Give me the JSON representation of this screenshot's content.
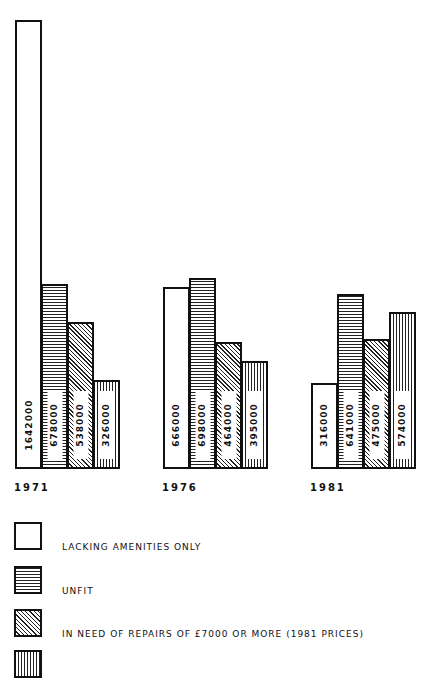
{
  "chart_data": {
    "type": "bar",
    "title": "",
    "xlabel": "",
    "ylabel": "",
    "grid": false,
    "legend_position": "bottom",
    "categories": [
      "1971",
      "1976",
      "1981"
    ],
    "series": [
      {
        "name": "LACKING AMENITIES ONLY",
        "pattern": "white",
        "values": [
          1642000,
          666000,
          316000
        ],
        "labels": [
          "1642000",
          "666000",
          "316000"
        ]
      },
      {
        "name": "UNFIT",
        "pattern": "horizontal",
        "values": [
          678000,
          698000,
          641000
        ],
        "labels": [
          "678000",
          "698000",
          "641000"
        ]
      },
      {
        "name": "IN NEED OF REPAIRS OF £7000 OR MORE (1981 PRICES)",
        "pattern": "diagonal",
        "values": [
          538000,
          464000,
          475000
        ],
        "labels": [
          "538000",
          "464000",
          "475000"
        ]
      },
      {
        "name": "",
        "pattern": "vertical",
        "values": [
          326000,
          395000,
          574000
        ],
        "labels": [
          "326000",
          "395000",
          "574000"
        ]
      }
    ]
  },
  "years": [
    "1971",
    "1976",
    "1981"
  ],
  "legend": [
    {
      "label": "LACKING AMENITIES ONLY"
    },
    {
      "label": "UNFIT"
    },
    {
      "label": "IN NEED OF REPAIRS OF £7000 OR MORE (1981 PRICES)"
    },
    {
      "label": ""
    }
  ]
}
